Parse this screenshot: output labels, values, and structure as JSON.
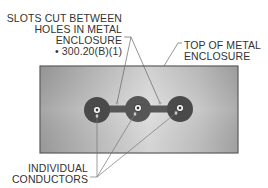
{
  "diagram": {
    "labels": {
      "slots": {
        "lines": [
          "SLOTS CUT BETWEEN",
          "HOLES IN METAL",
          "ENCLOSURE"
        ],
        "reference": "• 300.20(B)(1)"
      },
      "top_of_enclosure": {
        "lines": [
          "TOP OF METAL",
          "ENCLOSURE"
        ]
      },
      "conductors": {
        "lines": [
          "INDIVIDUAL",
          "CONDUCTORS"
        ]
      }
    },
    "components": {
      "enclosure_plate": "metal enclosure top",
      "holes": 3,
      "slots": 2,
      "conductors": 3
    },
    "colors": {
      "plate_light": "#dcdcdc",
      "plate_dark": "#a8a8a8",
      "plate_border": "#555555",
      "hole": "#4a4a4a",
      "conductor": "#ffffff",
      "leader": "#666666",
      "text": "#333333"
    }
  }
}
